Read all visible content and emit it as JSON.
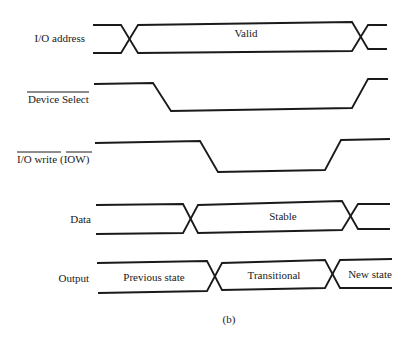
{
  "diagram": {
    "type": "timing-diagram",
    "caption": "(b)",
    "signals": [
      {
        "id": "io-address",
        "label": "I/O address",
        "overbar": false,
        "kind": "bus",
        "segments": [
          "",
          "Valid",
          ""
        ]
      },
      {
        "id": "device-select",
        "label": "Device Select",
        "overbar": true,
        "kind": "digital",
        "sequence": [
          "high",
          "low",
          "high"
        ]
      },
      {
        "id": "io-write",
        "label": "I/O write (IOW)",
        "label_main": "I/O write",
        "label_paren": "(IOW)",
        "overbar": true,
        "kind": "digital",
        "sequence": [
          "high",
          "low",
          "high"
        ]
      },
      {
        "id": "data",
        "label": "Data",
        "overbar": false,
        "kind": "bus",
        "segments": [
          "",
          "Stable",
          ""
        ]
      },
      {
        "id": "output",
        "label": "Output",
        "overbar": false,
        "kind": "bus",
        "segments": [
          "Previous state",
          "Transitional",
          "New state"
        ]
      }
    ],
    "color": "#1a1a1a"
  }
}
